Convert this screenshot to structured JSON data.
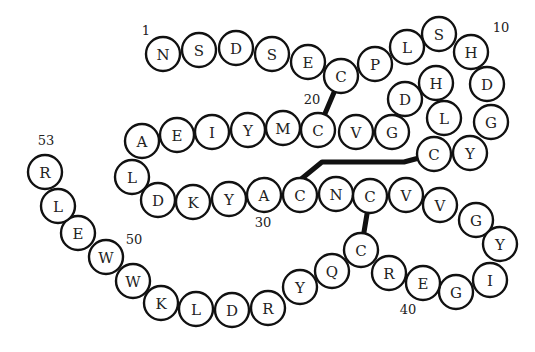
{
  "diagram": {
    "type": "protein-sequence",
    "residue_radius": 17,
    "residues": [
      {
        "n": 1,
        "aa": "N",
        "x": 163,
        "y": 54
      },
      {
        "n": 2,
        "aa": "S",
        "x": 199,
        "y": 50
      },
      {
        "n": 3,
        "aa": "D",
        "x": 236,
        "y": 48
      },
      {
        "n": 4,
        "aa": "S",
        "x": 272,
        "y": 54
      },
      {
        "n": 5,
        "aa": "E",
        "x": 308,
        "y": 62
      },
      {
        "n": 6,
        "aa": "C",
        "x": 341,
        "y": 76
      },
      {
        "n": 7,
        "aa": "P",
        "x": 375,
        "y": 64
      },
      {
        "n": 8,
        "aa": "L",
        "x": 407,
        "y": 47
      },
      {
        "n": 9,
        "aa": "S",
        "x": 439,
        "y": 34
      },
      {
        "n": 10,
        "aa": "H",
        "x": 471,
        "y": 52
      },
      {
        "n": 11,
        "aa": "D",
        "x": 487,
        "y": 84
      },
      {
        "n": 12,
        "aa": "G",
        "x": 491,
        "y": 122
      },
      {
        "n": 13,
        "aa": "Y",
        "x": 470,
        "y": 153
      },
      {
        "n": 14,
        "aa": "C",
        "x": 434,
        "y": 154
      },
      {
        "n": 15,
        "aa": "L",
        "x": 444,
        "y": 118
      },
      {
        "n": 16,
        "aa": "H",
        "x": 436,
        "y": 83
      },
      {
        "n": 17,
        "aa": "D",
        "x": 405,
        "y": 99
      },
      {
        "n": 18,
        "aa": "G",
        "x": 392,
        "y": 132
      },
      {
        "n": 19,
        "aa": "V",
        "x": 356,
        "y": 132
      },
      {
        "n": 20,
        "aa": "C",
        "x": 318,
        "y": 130
      },
      {
        "n": 21,
        "aa": "M",
        "x": 283,
        "y": 128
      },
      {
        "n": 22,
        "aa": "Y",
        "x": 248,
        "y": 130
      },
      {
        "n": 23,
        "aa": "I",
        "x": 212,
        "y": 132
      },
      {
        "n": 24,
        "aa": "E",
        "x": 177,
        "y": 135
      },
      {
        "n": 25,
        "aa": "A",
        "x": 142,
        "y": 141
      },
      {
        "n": 26,
        "aa": "L",
        "x": 132,
        "y": 177
      },
      {
        "n": 27,
        "aa": "D",
        "x": 158,
        "y": 200
      },
      {
        "n": 28,
        "aa": "K",
        "x": 193,
        "y": 202
      },
      {
        "n": 29,
        "aa": "Y",
        "x": 229,
        "y": 199
      },
      {
        "n": 30,
        "aa": "A",
        "x": 264,
        "y": 195
      },
      {
        "n": 31,
        "aa": "C",
        "x": 300,
        "y": 195
      },
      {
        "n": 32,
        "aa": "N",
        "x": 336,
        "y": 194
      },
      {
        "n": 33,
        "aa": "C",
        "x": 370,
        "y": 196
      },
      {
        "n": 34,
        "aa": "V",
        "x": 406,
        "y": 195
      },
      {
        "n": 35,
        "aa": "V",
        "x": 440,
        "y": 205
      },
      {
        "n": 36,
        "aa": "G",
        "x": 476,
        "y": 220
      },
      {
        "n": 37,
        "aa": "Y",
        "x": 500,
        "y": 244
      },
      {
        "n": 38,
        "aa": "I",
        "x": 490,
        "y": 280
      },
      {
        "n": 39,
        "aa": "G",
        "x": 456,
        "y": 292
      },
      {
        "n": 40,
        "aa": "E",
        "x": 423,
        "y": 283
      },
      {
        "n": 41,
        "aa": "R",
        "x": 389,
        "y": 273
      },
      {
        "n": 42,
        "aa": "C",
        "x": 361,
        "y": 250
      },
      {
        "n": 43,
        "aa": "Q",
        "x": 332,
        "y": 271
      },
      {
        "n": 44,
        "aa": "Y",
        "x": 300,
        "y": 287
      },
      {
        "n": 45,
        "aa": "R",
        "x": 268,
        "y": 308
      },
      {
        "n": 46,
        "aa": "D",
        "x": 232,
        "y": 310
      },
      {
        "n": 47,
        "aa": "L",
        "x": 196,
        "y": 309
      },
      {
        "n": 48,
        "aa": "K",
        "x": 161,
        "y": 303
      },
      {
        "n": 49,
        "aa": "W",
        "x": 133,
        "y": 281
      },
      {
        "n": 50,
        "aa": "W",
        "x": 106,
        "y": 257
      },
      {
        "n": 51,
        "aa": "E",
        "x": 78,
        "y": 233
      },
      {
        "n": 52,
        "aa": "L",
        "x": 58,
        "y": 206
      },
      {
        "n": 53,
        "aa": "R",
        "x": 45,
        "y": 172
      }
    ],
    "position_labels": [
      {
        "text": "1",
        "x": 146,
        "y": 30
      },
      {
        "text": "10",
        "x": 501,
        "y": 27
      },
      {
        "text": "20",
        "x": 312,
        "y": 99
      },
      {
        "text": "30",
        "x": 263,
        "y": 222
      },
      {
        "text": "40",
        "x": 408,
        "y": 309
      },
      {
        "text": "50",
        "x": 134,
        "y": 239
      },
      {
        "text": "53",
        "x": 46,
        "y": 140
      }
    ],
    "disulfide_bonds": [
      {
        "from": 6,
        "to": 20,
        "path": [
          [
            341,
            76
          ],
          [
            318,
            130
          ]
        ]
      },
      {
        "from": 14,
        "to": 31,
        "path": [
          [
            434,
            154
          ],
          [
            404,
            162
          ],
          [
            322,
            162
          ],
          [
            300,
            180
          ]
        ]
      },
      {
        "from": 33,
        "to": 42,
        "path": [
          [
            370,
            196
          ],
          [
            361,
            250
          ]
        ]
      }
    ]
  }
}
